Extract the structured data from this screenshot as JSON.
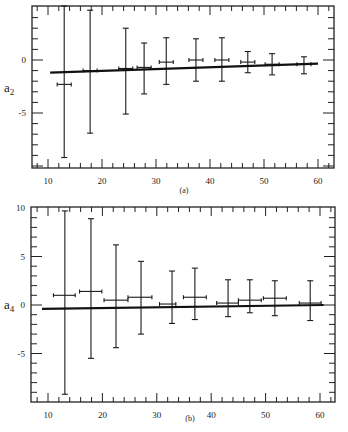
{
  "chart_data": [
    {
      "type": "scatter",
      "panel_label": "(a)",
      "title": "",
      "xlabel": "",
      "ylabel": "a2",
      "ylabel_main": "a",
      "ylabel_sub": "2",
      "xlim": [
        7,
        63
      ],
      "ylim": [
        -10.2,
        5.1
      ],
      "xticks": [
        10,
        20,
        30,
        40,
        50,
        60
      ],
      "yticks": [
        0,
        -5
      ],
      "ytick_labels": [
        "0",
        "-5"
      ],
      "grid": false,
      "legend": null,
      "series": [
        {
          "name": "measured",
          "style": "errorbars",
          "points": [
            {
              "x": 13.0,
              "y": -2.3,
              "xerr": [
                11.7,
                14.3
              ],
              "yerr": [
                -9.2,
                5.1
              ]
            },
            {
              "x": 17.8,
              "y": -1.0,
              "xerr": [
                16.5,
                19.1
              ],
              "yerr": [
                -6.9,
                4.7
              ]
            },
            {
              "x": 24.4,
              "y": -0.8,
              "xerr": [
                23.1,
                25.7
              ],
              "yerr": [
                -5.1,
                3.0
              ]
            },
            {
              "x": 27.8,
              "y": -0.7,
              "xerr": [
                26.5,
                29.1
              ],
              "yerr": [
                -3.2,
                1.6
              ]
            },
            {
              "x": 31.9,
              "y": -0.2,
              "xerr": [
                30.6,
                33.2
              ],
              "yerr": [
                -2.3,
                2.1
              ]
            },
            {
              "x": 37.4,
              "y": 0.0,
              "xerr": [
                36.1,
                38.7
              ],
              "yerr": [
                -2.0,
                2.0
              ]
            },
            {
              "x": 42.2,
              "y": 0.0,
              "xerr": [
                40.9,
                43.5
              ],
              "yerr": [
                -2.0,
                2.1
              ]
            },
            {
              "x": 47.0,
              "y": -0.2,
              "xerr": [
                45.7,
                48.3
              ],
              "yerr": [
                -1.2,
                0.8
              ]
            },
            {
              "x": 51.5,
              "y": -0.4,
              "xerr": [
                50.2,
                52.8
              ],
              "yerr": [
                -1.4,
                0.6
              ]
            },
            {
              "x": 57.4,
              "y": -0.4,
              "xerr": [
                56.1,
                58.7
              ],
              "yerr": [
                -1.3,
                0.3
              ]
            }
          ]
        },
        {
          "name": "fit",
          "style": "line",
          "x": [
            10.4,
            60.0
          ],
          "y": [
            -1.2,
            -0.35
          ]
        }
      ]
    },
    {
      "type": "scatter",
      "panel_label": "(b)",
      "title": "",
      "xlabel": "",
      "ylabel": "a4",
      "ylabel_main": "a",
      "ylabel_sub": "4",
      "xlim": [
        6.9,
        63.1
      ],
      "ylim": [
        -10,
        10
      ],
      "xticks": [
        10,
        20,
        30,
        40,
        50,
        60
      ],
      "yticks": [
        10,
        5,
        0,
        -5
      ],
      "ytick_labels": [
        "10",
        "5",
        "0",
        "-5"
      ],
      "grid": false,
      "legend": null,
      "series": [
        {
          "name": "measured",
          "style": "errorbars",
          "points": [
            {
              "x": 13.1,
              "y": 1.0,
              "xerr": [
                11.0,
                15.0
              ],
              "yerr": [
                -9.2,
                9.7
              ]
            },
            {
              "x": 17.9,
              "y": 1.4,
              "xerr": [
                15.8,
                19.9
              ],
              "yerr": [
                -5.5,
                8.9
              ]
            },
            {
              "x": 22.5,
              "y": 0.5,
              "xerr": [
                20.3,
                24.7
              ],
              "yerr": [
                -4.4,
                6.2
              ]
            },
            {
              "x": 27.1,
              "y": 0.8,
              "xerr": [
                24.7,
                29.1
              ],
              "yerr": [
                -3.0,
                4.5
              ]
            },
            {
              "x": 32.8,
              "y": 0.1,
              "xerr": [
                30.5,
                33.5
              ],
              "yerr": [
                -1.9,
                3.5
              ]
            },
            {
              "x": 37.0,
              "y": 0.8,
              "xerr": [
                34.9,
                39.1
              ],
              "yerr": [
                -1.5,
                3.8
              ]
            },
            {
              "x": 43.1,
              "y": 0.2,
              "xerr": [
                41.0,
                45.0
              ],
              "yerr": [
                -1.2,
                2.6
              ]
            },
            {
              "x": 47.1,
              "y": 0.5,
              "xerr": [
                45.0,
                49.2
              ],
              "yerr": [
                -0.8,
                2.6
              ]
            },
            {
              "x": 51.7,
              "y": 0.7,
              "xerr": [
                49.6,
                53.8
              ],
              "yerr": [
                -1.1,
                2.5
              ]
            },
            {
              "x": 58.2,
              "y": 0.2,
              "xerr": [
                56.2,
                60.2
              ],
              "yerr": [
                -1.6,
                2.5
              ]
            }
          ]
        },
        {
          "name": "fit",
          "style": "line",
          "x": [
            8.9,
            60.7
          ],
          "y": [
            -0.4,
            0.0
          ]
        }
      ]
    }
  ],
  "layout": {
    "panels": [
      {
        "frame": {
          "left": 32,
          "top": 6,
          "right": 334,
          "bottom": 168
        },
        "xpix": [
          48,
          318
        ],
        "xval": [
          10,
          60
        ],
        "ypix0": 60,
        "yscale": 10.6,
        "minor_x_step": 2,
        "minor_y_step": 1,
        "label_pos": [
          184,
          193
        ],
        "ylabel_pos": [
          4,
          92
        ],
        "tick_label_y": 184
      },
      {
        "frame": {
          "left": 31,
          "top": 207,
          "right": 335,
          "bottom": 402
        },
        "xpix": [
          48,
          320
        ],
        "xval": [
          10,
          60
        ],
        "ypix0": 305,
        "yscale": 9.7,
        "minor_x_step": 2,
        "minor_y_step": 1,
        "label_pos": [
          190,
          421
        ],
        "ylabel_pos": [
          4,
          309
        ],
        "tick_label_y": 418
      }
    ]
  }
}
